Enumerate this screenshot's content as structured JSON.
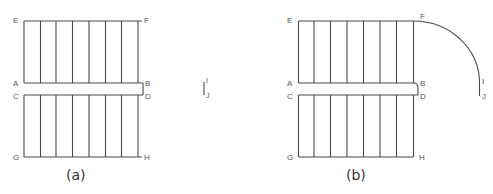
{
  "figure_a": {
    "caption": "(a)",
    "labels": {
      "E": "E",
      "F": "F",
      "A": "A",
      "B": "B",
      "C": "C",
      "D": "D",
      "G": "G",
      "H": "H",
      "I": "I",
      "J": "J"
    }
  },
  "figure_b": {
    "caption": "(b)",
    "labels": {
      "E": "E",
      "F": "F",
      "A": "A",
      "B": "B",
      "C": "C",
      "D": "D",
      "G": "G",
      "H": "H",
      "I": "I",
      "J": "J"
    }
  },
  "colors": {
    "line": "#4a4a4a",
    "label": "#555555"
  }
}
